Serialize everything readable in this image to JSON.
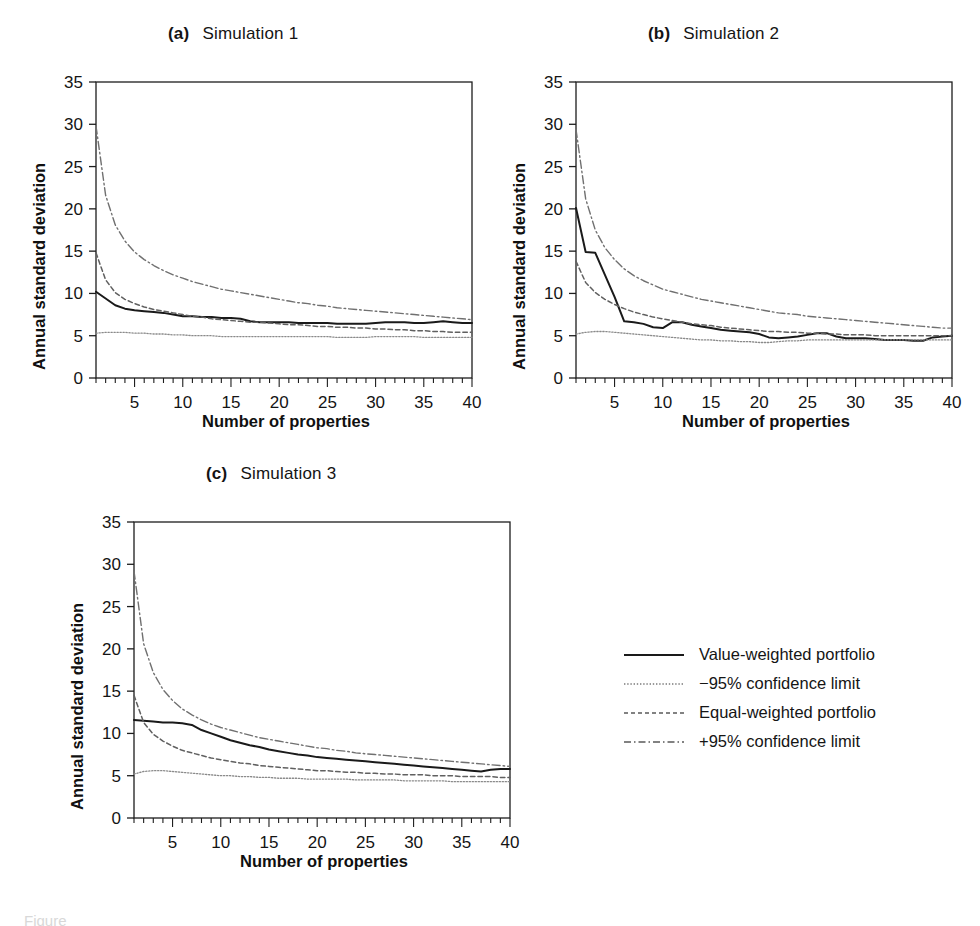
{
  "figure": {
    "caption_fragment": "Figure",
    "axis_titles": {
      "x": "Number of properties",
      "y": "Annual standard deviation"
    }
  },
  "panels": [
    {
      "tag": "(a)",
      "name": "Simulation 1"
    },
    {
      "tag": "(b)",
      "name": "Simulation 2"
    },
    {
      "tag": "(c)",
      "name": "Simulation 3"
    }
  ],
  "legend": {
    "items": [
      {
        "label": "Value-weighted portfolio",
        "style": "solid",
        "color": "#1a1a1a"
      },
      {
        "label": "−95% confidence limit",
        "style": "dotted",
        "color": "#6e6e6e"
      },
      {
        "label": "Equal-weighted portfolio",
        "style": "dashed",
        "color": "#4a4a4a"
      },
      {
        "label": "+95% confidence limit",
        "style": "dashdot",
        "color": "#5a5a5a"
      }
    ]
  },
  "chart_data": [
    {
      "id": "simulation-1",
      "type": "line",
      "title": "(a)  Simulation 1",
      "xlabel": "Number of properties",
      "ylabel": "Annual standard deviation",
      "xlim": [
        1,
        40
      ],
      "ylim": [
        0,
        35
      ],
      "xticks": [
        5,
        10,
        15,
        20,
        25,
        30,
        35,
        40
      ],
      "yticks": [
        0,
        5,
        10,
        15,
        20,
        25,
        30,
        35
      ],
      "minor_xtick_step": 1,
      "grid": false,
      "legend_position": "outside-right-below",
      "x": [
        1,
        2,
        3,
        4,
        5,
        6,
        7,
        8,
        9,
        10,
        11,
        12,
        13,
        14,
        15,
        16,
        17,
        18,
        19,
        20,
        21,
        22,
        23,
        24,
        25,
        26,
        27,
        28,
        29,
        30,
        31,
        32,
        33,
        34,
        35,
        36,
        37,
        38,
        39,
        40
      ],
      "series": [
        {
          "name": "Value-weighted portfolio",
          "style": "solid",
          "values": [
            10.2,
            9.4,
            8.6,
            8.2,
            8.0,
            7.9,
            7.8,
            7.7,
            7.5,
            7.3,
            7.3,
            7.2,
            7.2,
            7.1,
            7.1,
            7.0,
            6.7,
            6.6,
            6.6,
            6.6,
            6.6,
            6.5,
            6.5,
            6.5,
            6.5,
            6.4,
            6.4,
            6.4,
            6.4,
            6.5,
            6.6,
            6.6,
            6.6,
            6.5,
            6.5,
            6.6,
            6.7,
            6.6,
            6.5,
            6.5
          ]
        },
        {
          "name": "−95% confidence limit",
          "style": "dotted",
          "values": [
            5.3,
            5.4,
            5.4,
            5.4,
            5.3,
            5.3,
            5.2,
            5.2,
            5.1,
            5.1,
            5.0,
            5.0,
            5.0,
            4.9,
            4.9,
            4.9,
            4.9,
            4.9,
            4.9,
            4.9,
            4.9,
            4.9,
            4.9,
            4.9,
            4.9,
            4.8,
            4.8,
            4.8,
            4.8,
            4.9,
            4.9,
            4.9,
            4.9,
            4.9,
            4.8,
            4.8,
            4.8,
            4.8,
            4.8,
            4.8
          ]
        },
        {
          "name": "Equal-weighted portfolio",
          "style": "dashed",
          "values": [
            14.8,
            11.6,
            10.1,
            9.3,
            8.8,
            8.4,
            8.1,
            7.9,
            7.7,
            7.5,
            7.3,
            7.2,
            7.0,
            6.9,
            6.8,
            6.7,
            6.6,
            6.6,
            6.5,
            6.4,
            6.3,
            6.3,
            6.2,
            6.1,
            6.1,
            6.0,
            6.0,
            5.9,
            5.9,
            5.8,
            5.8,
            5.7,
            5.7,
            5.6,
            5.6,
            5.5,
            5.5,
            5.4,
            5.4,
            5.4
          ]
        },
        {
          "name": "+95% confidence limit",
          "style": "dashdot",
          "values": [
            29.8,
            21.6,
            18.1,
            16.2,
            14.9,
            14.0,
            13.3,
            12.7,
            12.2,
            11.8,
            11.4,
            11.1,
            10.8,
            10.5,
            10.3,
            10.1,
            9.9,
            9.7,
            9.5,
            9.3,
            9.1,
            8.9,
            8.8,
            8.6,
            8.5,
            8.3,
            8.2,
            8.1,
            8.0,
            7.9,
            7.8,
            7.7,
            7.6,
            7.5,
            7.4,
            7.3,
            7.2,
            7.1,
            7.0,
            6.9
          ]
        }
      ]
    },
    {
      "id": "simulation-2",
      "type": "line",
      "title": "(b)  Simulation 2",
      "xlabel": "Number of properties",
      "ylabel": "Annual standard deviation",
      "xlim": [
        1,
        40
      ],
      "ylim": [
        0,
        35
      ],
      "xticks": [
        5,
        10,
        15,
        20,
        25,
        30,
        35,
        40
      ],
      "yticks": [
        0,
        5,
        10,
        15,
        20,
        25,
        30,
        35
      ],
      "minor_xtick_step": 1,
      "grid": false,
      "legend_position": "outside-right-below",
      "x": [
        1,
        2,
        3,
        4,
        5,
        6,
        7,
        8,
        9,
        10,
        11,
        12,
        13,
        14,
        15,
        16,
        17,
        18,
        19,
        20,
        21,
        22,
        23,
        24,
        25,
        26,
        27,
        28,
        29,
        30,
        31,
        32,
        33,
        34,
        35,
        36,
        37,
        38,
        39,
        40
      ],
      "series": [
        {
          "name": "Value-weighted portfolio",
          "style": "solid",
          "values": [
            20.1,
            14.9,
            14.8,
            12.2,
            9.6,
            6.7,
            6.6,
            6.4,
            6.0,
            5.9,
            6.6,
            6.6,
            6.3,
            6.1,
            5.9,
            5.7,
            5.6,
            5.5,
            5.4,
            5.2,
            4.8,
            4.7,
            4.8,
            4.9,
            5.1,
            5.3,
            5.3,
            4.9,
            4.7,
            4.7,
            4.7,
            4.6,
            4.5,
            4.5,
            4.5,
            4.4,
            4.4,
            4.8,
            4.9,
            5.0
          ]
        },
        {
          "name": "−95% confidence limit",
          "style": "dotted",
          "values": [
            5.2,
            5.4,
            5.5,
            5.5,
            5.4,
            5.3,
            5.2,
            5.1,
            5.0,
            4.9,
            4.8,
            4.7,
            4.6,
            4.5,
            4.5,
            4.4,
            4.4,
            4.3,
            4.3,
            4.2,
            4.2,
            4.3,
            4.4,
            4.4,
            4.5,
            4.5,
            4.5,
            4.5,
            4.5,
            4.5,
            4.5,
            4.5,
            4.5,
            4.5,
            4.5,
            4.5,
            4.5,
            4.5,
            4.5,
            4.5
          ]
        },
        {
          "name": "Equal-weighted portfolio",
          "style": "dashed",
          "values": [
            13.8,
            11.3,
            10.1,
            9.3,
            8.7,
            8.2,
            7.8,
            7.5,
            7.2,
            7.0,
            6.8,
            6.6,
            6.4,
            6.3,
            6.2,
            6.0,
            5.9,
            5.8,
            5.7,
            5.6,
            5.5,
            5.5,
            5.4,
            5.4,
            5.3,
            5.3,
            5.2,
            5.2,
            5.1,
            5.1,
            5.1,
            5.0,
            5.0,
            5.0,
            5.0,
            5.0,
            5.0,
            5.0,
            5.0,
            5.0
          ]
        },
        {
          "name": "+95% confidence limit",
          "style": "dashdot",
          "values": [
            29.4,
            21.2,
            17.5,
            15.4,
            14.0,
            12.9,
            12.1,
            11.5,
            11.0,
            10.5,
            10.2,
            9.9,
            9.6,
            9.3,
            9.1,
            8.9,
            8.7,
            8.5,
            8.3,
            8.1,
            7.9,
            7.7,
            7.6,
            7.5,
            7.3,
            7.2,
            7.1,
            7.0,
            6.9,
            6.8,
            6.7,
            6.6,
            6.5,
            6.4,
            6.3,
            6.2,
            6.1,
            6.0,
            5.9,
            5.9
          ]
        }
      ]
    },
    {
      "id": "simulation-3",
      "type": "line",
      "title": "(c)  Simulation 3",
      "xlabel": "Number of properties",
      "ylabel": "Annual standard deviation",
      "xlim": [
        1,
        40
      ],
      "ylim": [
        0,
        35
      ],
      "xticks": [
        5,
        10,
        15,
        20,
        25,
        30,
        35,
        40
      ],
      "yticks": [
        0,
        5,
        10,
        15,
        20,
        25,
        30,
        35
      ],
      "minor_xtick_step": 1,
      "grid": false,
      "legend_position": "outside-right",
      "x": [
        1,
        2,
        3,
        4,
        5,
        6,
        7,
        8,
        9,
        10,
        11,
        12,
        13,
        14,
        15,
        16,
        17,
        18,
        19,
        20,
        21,
        22,
        23,
        24,
        25,
        26,
        27,
        28,
        29,
        30,
        31,
        32,
        33,
        34,
        35,
        36,
        37,
        38,
        39,
        40
      ],
      "series": [
        {
          "name": "Value-weighted portfolio",
          "style": "solid",
          "values": [
            11.6,
            11.5,
            11.4,
            11.3,
            11.3,
            11.2,
            11.0,
            10.4,
            10.0,
            9.6,
            9.2,
            8.9,
            8.6,
            8.4,
            8.1,
            7.9,
            7.7,
            7.5,
            7.4,
            7.2,
            7.1,
            7.0,
            6.9,
            6.8,
            6.7,
            6.6,
            6.5,
            6.4,
            6.3,
            6.2,
            6.1,
            6.0,
            5.9,
            5.8,
            5.7,
            5.6,
            5.5,
            5.7,
            5.8,
            5.8
          ]
        },
        {
          "name": "−95% confidence limit",
          "style": "dotted",
          "values": [
            5.2,
            5.5,
            5.6,
            5.6,
            5.5,
            5.4,
            5.3,
            5.2,
            5.1,
            5.0,
            5.0,
            4.9,
            4.9,
            4.8,
            4.8,
            4.7,
            4.7,
            4.7,
            4.6,
            4.6,
            4.6,
            4.6,
            4.6,
            4.5,
            4.5,
            4.5,
            4.5,
            4.5,
            4.4,
            4.4,
            4.4,
            4.4,
            4.4,
            4.3,
            4.3,
            4.3,
            4.3,
            4.3,
            4.3,
            4.3
          ]
        },
        {
          "name": "Equal-weighted portfolio",
          "style": "dashed",
          "values": [
            14.5,
            11.3,
            9.9,
            9.1,
            8.5,
            8.0,
            7.7,
            7.4,
            7.1,
            6.9,
            6.7,
            6.5,
            6.4,
            6.2,
            6.1,
            6.0,
            5.9,
            5.8,
            5.7,
            5.6,
            5.6,
            5.5,
            5.4,
            5.4,
            5.3,
            5.3,
            5.2,
            5.2,
            5.1,
            5.1,
            5.1,
            5.0,
            5.0,
            5.0,
            4.9,
            4.9,
            4.9,
            4.9,
            4.8,
            4.8
          ]
        },
        {
          "name": "+95% confidence limit",
          "style": "dashdot",
          "values": [
            29.2,
            20.6,
            17.2,
            15.2,
            13.9,
            12.9,
            12.2,
            11.6,
            11.1,
            10.7,
            10.4,
            10.1,
            9.8,
            9.5,
            9.3,
            9.1,
            8.9,
            8.7,
            8.5,
            8.3,
            8.2,
            8.0,
            7.9,
            7.7,
            7.6,
            7.5,
            7.4,
            7.3,
            7.2,
            7.1,
            7.0,
            6.9,
            6.8,
            6.7,
            6.6,
            6.5,
            6.4,
            6.3,
            6.2,
            6.1
          ]
        }
      ]
    }
  ]
}
